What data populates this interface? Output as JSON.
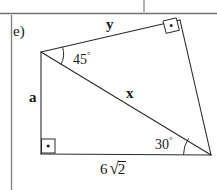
{
  "page": {
    "background": "#ffffff",
    "ink": "#1a1a1a",
    "width": 217,
    "height": 190
  },
  "rules": {
    "top_horizontal_rule": "horizontal-rule",
    "top_vertical_tick": "vertical-tick",
    "left_margin_rule": "vertical-rule"
  },
  "figure": {
    "problem_label": "e)",
    "type": "geometry-quadrilateral",
    "vertices": {
      "top_left": [
        41,
        52
      ],
      "top_right": [
        180,
        20
      ],
      "bottom_right": [
        211,
        155
      ],
      "bottom_left": [
        41,
        154
      ]
    },
    "edges": [
      {
        "name": "side-y",
        "label": "y",
        "from": "top_left",
        "to": "top_right"
      },
      {
        "name": "side-right",
        "label": "",
        "from": "top_right",
        "to": "bottom_right"
      },
      {
        "name": "side-base",
        "label": "6√2",
        "from": "bottom_left",
        "to": "bottom_right"
      },
      {
        "name": "side-a",
        "label": "a",
        "from": "top_left",
        "to": "bottom_left"
      },
      {
        "name": "diagonal-x",
        "label": "x",
        "from": "top_left",
        "to": "bottom_right"
      }
    ],
    "labels": {
      "y": "y",
      "x": "x",
      "a": "a",
      "base_coefficient": "6",
      "base_radicand": "2",
      "base_full": "6√2"
    },
    "angles": [
      {
        "name": "angle-45",
        "value": "45",
        "unit": "°",
        "at": "top_left",
        "marker": "arc"
      },
      {
        "name": "angle-30",
        "value": "30",
        "unit": "°",
        "at": "bottom_right",
        "marker": "arc"
      }
    ],
    "right_angles": [
      {
        "name": "right-angle-top-right",
        "at": "top_right",
        "marker": "square-with-dot"
      },
      {
        "name": "right-angle-bottom-left",
        "at": "bottom_left",
        "marker": "square-with-dot"
      }
    ]
  }
}
